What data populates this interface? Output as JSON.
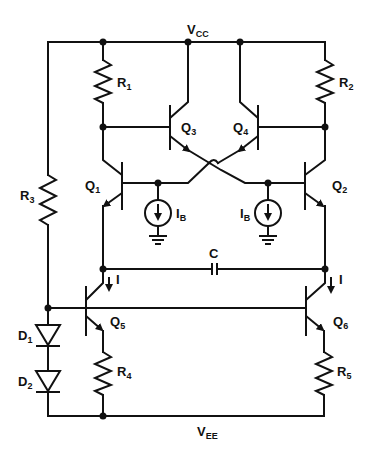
{
  "diagram": {
    "type": "circuit-schematic",
    "rails": {
      "positive": {
        "label": "V",
        "sub": "CC"
      },
      "negative": {
        "label": "V",
        "sub": "EE"
      }
    },
    "resistors": [
      {
        "id": "R1",
        "label": "R",
        "sub": "1"
      },
      {
        "id": "R2",
        "label": "R",
        "sub": "2"
      },
      {
        "id": "R3",
        "label": "R",
        "sub": "3"
      },
      {
        "id": "R4",
        "label": "R",
        "sub": "4"
      },
      {
        "id": "R5",
        "label": "R",
        "sub": "5"
      }
    ],
    "transistors": [
      {
        "id": "Q1",
        "label": "Q",
        "sub": "1"
      },
      {
        "id": "Q2",
        "label": "Q",
        "sub": "2"
      },
      {
        "id": "Q3",
        "label": "Q",
        "sub": "3"
      },
      {
        "id": "Q4",
        "label": "Q",
        "sub": "4"
      },
      {
        "id": "Q5",
        "label": "Q",
        "sub": "5"
      },
      {
        "id": "Q6",
        "label": "Q",
        "sub": "6"
      }
    ],
    "diodes": [
      {
        "id": "D1",
        "label": "D",
        "sub": "1"
      },
      {
        "id": "D2",
        "label": "D",
        "sub": "2"
      }
    ],
    "current_sources": [
      {
        "id": "IB_left",
        "label": "I",
        "sub": "B"
      },
      {
        "id": "IB_right",
        "label": "I",
        "sub": "B"
      }
    ],
    "capacitor": {
      "id": "C",
      "label": "C"
    },
    "currents": [
      {
        "id": "I_left",
        "label": "I"
      },
      {
        "id": "I_right",
        "label": "I"
      }
    ]
  }
}
